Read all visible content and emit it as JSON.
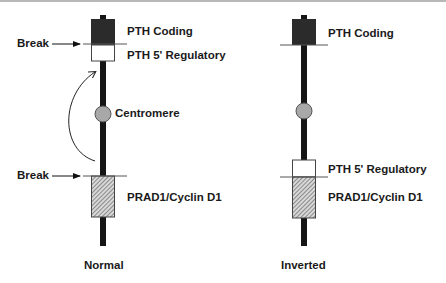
{
  "diagram": {
    "type": "chromosome-inversion",
    "colors": {
      "coding_fill": "#2b2b2b",
      "regulatory_fill": "#ffffff",
      "cyclin_hatch": "#8a8a8a",
      "centromere_fill": "#a8a8a8",
      "stem": "#151515"
    },
    "normal": {
      "caption": "Normal",
      "break_label_top": "Break",
      "break_label_bottom": "Break",
      "labels": {
        "coding": "PTH Coding",
        "regulatory": "PTH 5' Regulatory",
        "centromere": "Centromere",
        "cyclin": "PRAD1/Cyclin D1"
      }
    },
    "inverted": {
      "caption": "Inverted",
      "labels": {
        "coding": "PTH Coding",
        "regulatory": "PTH 5' Regulatory",
        "cyclin": "PRAD1/Cyclin D1"
      }
    }
  }
}
